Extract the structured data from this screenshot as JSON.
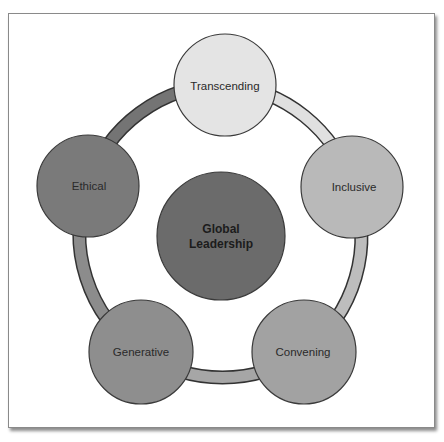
{
  "diagram": {
    "center": {
      "label_line1": "Global",
      "label_line2": "Leadership",
      "color": "#6b6b6b"
    },
    "nodes": [
      {
        "label": "Transcending",
        "color": "#e4e4e4"
      },
      {
        "label": "Inclusive",
        "color": "#b9b9b9"
      },
      {
        "label": "Convening",
        "color": "#a2a2a2"
      },
      {
        "label": "Generative",
        "color": "#8e8e8e"
      },
      {
        "label": "Ethical",
        "color": "#7a7a7a"
      }
    ],
    "ring_segments": [
      {
        "from": "Transcending",
        "to": "Inclusive",
        "color": "#e0e0e0"
      },
      {
        "from": "Inclusive",
        "to": "Convening",
        "color": "#bdbdbd"
      },
      {
        "from": "Convening",
        "to": "Generative",
        "color": "#a6a6a6"
      },
      {
        "from": "Generative",
        "to": "Ethical",
        "color": "#8c8c8c"
      },
      {
        "from": "Ethical",
        "to": "Transcending",
        "color": "#747474"
      }
    ],
    "outline_color": "#333333"
  }
}
